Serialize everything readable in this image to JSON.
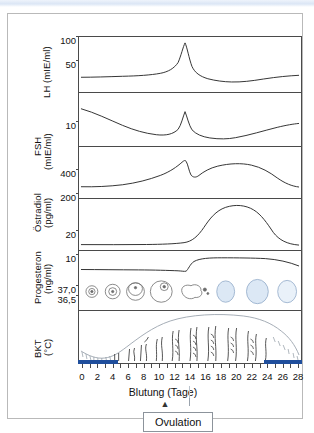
{
  "figure": {
    "xlabel": "Blutung (Tage)",
    "annotation_label": "Ovulation",
    "ovulation_day": 14
  },
  "axes": [
    {
      "name": "LH",
      "label": "LH (mIE/ml)",
      "ticks": [
        "100",
        "50"
      ]
    },
    {
      "name": "FSH",
      "label": "FSH\n(mIE/ml)",
      "ticks": [
        "10"
      ]
    },
    {
      "name": "Oestradiol",
      "label": "Östradiol\n(pg/ml)",
      "ticks": [
        "400",
        "200"
      ]
    },
    {
      "name": "Progesteron",
      "label": "Progesteron\n(ng/ml)",
      "ticks": [
        "20",
        "10"
      ]
    },
    {
      "name": "BKT",
      "label": "BKT\n(°C)",
      "ticks": [
        "37,0",
        "36,5"
      ]
    }
  ],
  "axis_label_lh": "LH (mIE/ml)",
  "axis_label_fsh_name": "FSH",
  "axis_label_fsh_unit": "(mIE/ml)",
  "axis_label_oestradiol_name": "Östradiol",
  "axis_label_oestradiol_unit": "(pg/ml)",
  "axis_label_progesteron_name": "Progesteron",
  "axis_label_progesteron_unit": "(ng/ml)",
  "axis_label_bkt_name": "BKT",
  "axis_label_bkt_unit": "(°C)",
  "ticklabels": {
    "lh_100": "100",
    "lh_50": "50",
    "fsh_10": "10",
    "e2_400": "400",
    "e2_200": "200",
    "p_20": "20",
    "p_10": "10",
    "bkt_370": "37,0",
    "bkt_365": "36,5"
  },
  "xticks": [
    "0",
    "2",
    "4",
    "6",
    "8",
    "10",
    "12",
    "14",
    "16",
    "18",
    "20",
    "22",
    "24",
    "26",
    "28"
  ],
  "colors": {
    "bleeding_bar": "#1f4e9c",
    "curve": "#333333",
    "frame": "#4a4a4a",
    "follicle_pale_blue": "#dce8f5",
    "top_band": "#dbe6f5"
  },
  "chart_data": {
    "type": "line",
    "title": "",
    "xlabel": "Blutung (Tage)",
    "ylabel": "",
    "x": [
      0,
      1,
      2,
      3,
      4,
      5,
      6,
      7,
      8,
      9,
      10,
      11,
      12,
      13,
      14,
      15,
      16,
      17,
      18,
      19,
      20,
      21,
      22,
      23,
      24,
      25,
      26,
      27,
      28
    ],
    "xlim": [
      0,
      29
    ],
    "grid": false,
    "legend": "none",
    "annotations": [
      {
        "label": "Ovulation",
        "x": 14,
        "note": "arrow pointing to day 14 on the day axis"
      },
      {
        "label": "Blutung",
        "x_range": [
          0,
          5
        ],
        "note": "menstrual bleeding bar"
      },
      {
        "label": "Blutung",
        "x_range": [
          27,
          29
        ],
        "note": "menstrual bleeding bar next cycle"
      }
    ],
    "series": [
      {
        "name": "LH",
        "unit": "mIE/ml",
        "ylim": [
          0,
          110
        ],
        "yticks": [
          50,
          100
        ],
        "values": [
          22,
          22,
          22,
          22,
          22,
          22,
          22,
          22,
          22,
          23,
          23,
          24,
          26,
          34,
          85,
          45,
          28,
          22,
          19,
          18,
          18,
          19,
          20,
          21,
          22,
          23,
          24,
          25,
          26
        ]
      },
      {
        "name": "FSH",
        "unit": "mIE/ml",
        "ylim": [
          0,
          18
        ],
        "yticks": [
          10
        ],
        "values": [
          10.0,
          9.4,
          8.8,
          8.2,
          7.6,
          7.2,
          6.8,
          6.4,
          6.1,
          5.9,
          5.8,
          5.9,
          6.2,
          7.5,
          12.5,
          8.0,
          6.2,
          5.4,
          5.0,
          4.9,
          5.0,
          5.2,
          5.5,
          5.9,
          6.3,
          6.8,
          7.3,
          7.8,
          8.2
        ]
      },
      {
        "name": "Östradiol",
        "unit": "pg/ml",
        "ylim": [
          0,
          460
        ],
        "yticks": [
          200,
          400
        ],
        "values": [
          60,
          58,
          58,
          60,
          64,
          70,
          80,
          95,
          115,
          140,
          170,
          205,
          245,
          290,
          300,
          185,
          150,
          170,
          210,
          245,
          265,
          275,
          278,
          272,
          255,
          220,
          170,
          115,
          78
        ]
      },
      {
        "name": "Progesteron",
        "unit": "ng/ml",
        "ylim": [
          0,
          26
        ],
        "yticks": [
          10,
          20
        ],
        "values": [
          0.4,
          0.4,
          0.4,
          0.4,
          0.4,
          0.4,
          0.4,
          0.4,
          0.4,
          0.5,
          0.5,
          0.6,
          0.7,
          0.9,
          1.2,
          3.5,
          7.5,
          11.5,
          15.0,
          17.8,
          19.4,
          20.0,
          19.6,
          18.2,
          15.5,
          11.0,
          6.0,
          2.4,
          0.8
        ]
      },
      {
        "name": "BKT",
        "unit": "°C",
        "ylim": [
          36.3,
          37.2
        ],
        "yticks": [
          36.5,
          37.0
        ],
        "values": [
          36.55,
          36.55,
          36.52,
          36.5,
          36.5,
          36.52,
          36.52,
          36.5,
          36.5,
          36.48,
          36.48,
          36.5,
          36.5,
          36.45,
          36.5,
          36.85,
          36.95,
          37.0,
          37.0,
          37.02,
          37.02,
          37.0,
          37.0,
          37.0,
          36.98,
          36.95,
          36.9,
          36.75,
          36.6
        ]
      }
    ],
    "ovary_stages": [
      "primordial-follicle",
      "primary-follicle",
      "secondary-follicle",
      "graafian-follicle",
      "ruptured-follicle",
      "corpus-luteum-early",
      "corpus-luteum-mature",
      "corpus-albicans"
    ],
    "endometrium": {
      "note": "uterine lining thickens from menstruation through proliferative and secretory phases, then sheds"
    }
  }
}
